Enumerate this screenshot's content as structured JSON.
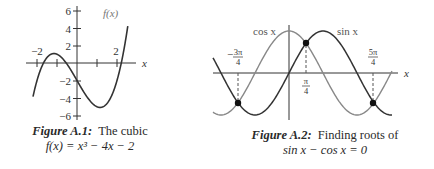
{
  "figures": [
    {
      "caption_label": "Figure A.1:",
      "caption_text": "The cubic",
      "caption_line2": "f(x) = x³ − 4x − 2",
      "curve_label": "f(x)",
      "x_axis_label": "x",
      "y_ticks": [
        "6",
        "4",
        "2",
        "−2",
        "−4",
        "−6"
      ],
      "x_tick_labels": [
        "−2",
        "2"
      ]
    },
    {
      "caption_label": "Figure A.2:",
      "caption_text": "Finding roots of",
      "caption_line2": "sin x − cos x = 0",
      "curve_labels": [
        "cos x",
        "sin x"
      ],
      "x_axis_label": "x",
      "point_labels": [
        "−3π/4",
        "π/4",
        "5π/4"
      ]
    }
  ],
  "chart_data": [
    {
      "type": "line",
      "title": "The cubic f(x) = x^3 - 4x - 2",
      "xlabel": "x",
      "ylabel": "",
      "series": [
        {
          "name": "f(x)",
          "formula": "x^3 - 4x - 2",
          "x": [
            -2.0,
            -1.5,
            -1.0,
            -0.5,
            0.0,
            0.5,
            1.0,
            1.5,
            2.0,
            2.5
          ],
          "values": [
            -2.0,
            0.625,
            1.0,
            -0.125,
            -2.0,
            -3.875,
            -5.0,
            -4.625,
            -2.0,
            3.625
          ]
        }
      ],
      "xticks": [
        -2,
        -1,
        1,
        2
      ],
      "xtick_labels": [
        "-2",
        "2"
      ],
      "yticks": [
        6,
        4,
        2,
        -2,
        -4,
        -6
      ],
      "xlim": [
        -2.2,
        2.6
      ],
      "ylim": [
        -6,
        6
      ],
      "roots": [
        -1.68,
        -0.54,
        2.21
      ],
      "grid": false
    },
    {
      "type": "line",
      "title": "Finding roots of sin x - cos x = 0",
      "xlabel": "x",
      "ylabel": "",
      "series": [
        {
          "name": "cos x",
          "formula": "cos(x)"
        },
        {
          "name": "sin x",
          "formula": "sin(x)"
        }
      ],
      "xlim": [
        -3.5,
        4.6
      ],
      "ylim": [
        -1,
        1
      ],
      "intersections": [
        {
          "x_label": "-3π/4",
          "x": -2.356,
          "y": -0.707
        },
        {
          "x_label": "π/4",
          "x": 0.785,
          "y": 0.707
        },
        {
          "x_label": "5π/4",
          "x": 3.927,
          "y": -0.707
        }
      ],
      "grid": false
    }
  ]
}
